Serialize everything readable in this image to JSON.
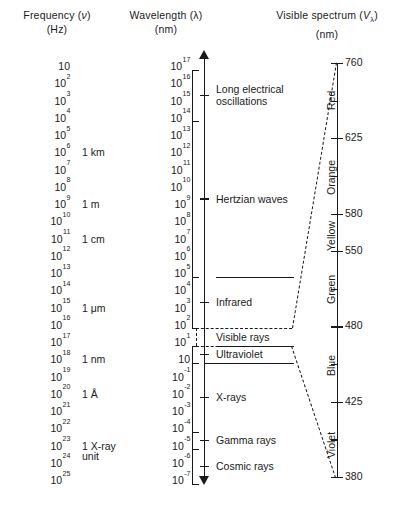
{
  "headers": {
    "frequency": {
      "line1_pre": "Frequency (",
      "line1_sym": "ν",
      "line1_post": ")",
      "line2": "(Hz)"
    },
    "wavelength": {
      "line1_pre": "Wavelength (",
      "line1_sym": "λ",
      "line1_post": ")",
      "line2": "(nm)"
    },
    "visible": {
      "line1_pre": "Visible spectrum (",
      "line1_sym": "V",
      "line1_sub": "λ",
      "line1_post": ")",
      "line2": "(nm)"
    }
  },
  "frequency_column": {
    "base": "10",
    "exponents": [
      "",
      "2",
      "3",
      "4",
      "5",
      "6",
      "7",
      "8",
      "9",
      "10",
      "11",
      "12",
      "13",
      "14",
      "15",
      "16",
      "17",
      "18",
      "19",
      "20",
      "21",
      "22",
      "23",
      "24",
      "25"
    ]
  },
  "wavelength_column": {
    "base": "10",
    "exponents": [
      "17",
      "16",
      "15",
      "14",
      "13",
      "12",
      "11",
      "10",
      "9",
      "8",
      "7",
      "6",
      "5",
      "4",
      "3",
      "2",
      "1",
      "",
      "-1",
      "-2",
      "-3",
      "-4",
      "-5",
      "-6",
      "-7"
    ]
  },
  "unit_markers": [
    {
      "label": "1 km",
      "row": 5
    },
    {
      "label": "1 m",
      "row": 8
    },
    {
      "label": "1 cm",
      "row": 10
    },
    {
      "label": "1 μm",
      "row": 14
    },
    {
      "label": "1 nm",
      "row": 17
    },
    {
      "label": "1 Å",
      "row": 19
    },
    {
      "label": "1 X-ray",
      "label2": "unit",
      "row": 22
    }
  ],
  "bands": [
    {
      "name": "Long electrical\noscillations",
      "top_row": 0,
      "bottom_row": 3
    },
    {
      "name": "Hertzian waves",
      "top_row": 3,
      "bottom_row": 12
    },
    {
      "name": "Infrared",
      "top_row": 12,
      "bottom_row": 15
    },
    {
      "name": "Visible rays",
      "top_row": 15,
      "bottom_row": 16
    },
    {
      "name": "Ultraviolet",
      "top_row": 16,
      "bottom_row": 17
    },
    {
      "name": "X-rays",
      "top_row": 17,
      "bottom_row": 21
    },
    {
      "name": "Gamma rays",
      "top_row": 21,
      "bottom_row": 22
    },
    {
      "name": "Cosmic rays",
      "top_row": 22,
      "bottom_row": 24
    }
  ],
  "visible_spectrum": {
    "ticks": [
      {
        "value": "760",
        "major": true
      },
      {
        "value": "",
        "major": false
      },
      {
        "value": "625",
        "major": true
      },
      {
        "value": "",
        "major": false
      },
      {
        "value": "580",
        "major": true
      },
      {
        "value": "550",
        "major": true
      },
      {
        "value": "",
        "major": false
      },
      {
        "value": "480",
        "major": true
      },
      {
        "value": "",
        "major": false
      },
      {
        "value": "425",
        "major": true
      },
      {
        "value": "",
        "major": false
      },
      {
        "value": "380",
        "major": true
      }
    ],
    "colors": [
      "Red",
      "Orange",
      "Yellow",
      "Green",
      "Blue",
      "Violet"
    ]
  },
  "chart_data": {
    "type": "table",
    "xlabel": "",
    "ylabel": "",
    "series": [
      {
        "name": "Frequency (Hz)",
        "values": [
          "10",
          "10^2",
          "10^3",
          "10^4",
          "10^5",
          "10^6",
          "10^7",
          "10^8",
          "10^9",
          "10^10",
          "10^11",
          "10^12",
          "10^13",
          "10^14",
          "10^15",
          "10^16",
          "10^17",
          "10^18",
          "10^19",
          "10^20",
          "10^21",
          "10^22",
          "10^23",
          "10^24",
          "10^25"
        ]
      },
      {
        "name": "Wavelength (nm)",
        "values": [
          "10^17",
          "10^16",
          "10^15",
          "10^14",
          "10^13",
          "10^12",
          "10^11",
          "10^10",
          "10^9",
          "10^8",
          "10^7",
          "10^6",
          "10^5",
          "10^4",
          "10^3",
          "10^2",
          "10^1",
          "1",
          "10^-1",
          "10^-2",
          "10^-3",
          "10^-4",
          "10^-5",
          "10^-6",
          "10^-7"
        ]
      }
    ],
    "band_ranges": [
      {
        "band": "Long electrical oscillations",
        "freq_hz": "10 - 10^4",
        "wavelength_nm": "10^17 - 10^14"
      },
      {
        "band": "Hertzian waves",
        "freq_hz": "10^4 - 10^13",
        "wavelength_nm": "10^14 - 10^5"
      },
      {
        "band": "Infrared",
        "freq_hz": "10^13 - 10^16",
        "wavelength_nm": "10^5 - 10^2"
      },
      {
        "band": "Visible rays",
        "freq_hz": "10^16 - 10^17",
        "wavelength_nm": "10^2 - 10^1"
      },
      {
        "band": "Ultraviolet",
        "freq_hz": "10^17 - 10^18",
        "wavelength_nm": "10^1 - 1"
      },
      {
        "band": "X-rays",
        "freq_hz": "10^18 - 10^22",
        "wavelength_nm": "1 - 10^-4"
      },
      {
        "band": "Gamma rays",
        "freq_hz": "10^22 - 10^23",
        "wavelength_nm": "10^-4 - 10^-5"
      },
      {
        "band": "Cosmic rays",
        "freq_hz": "10^23 - 10^25",
        "wavelength_nm": "10^-5 - 10^-7"
      }
    ],
    "visible_ticks_nm": [
      760,
      625,
      580,
      550,
      480,
      425,
      380
    ],
    "visible_colors": [
      "Red",
      "Orange",
      "Yellow",
      "Green",
      "Blue",
      "Violet"
    ],
    "grid": false,
    "legend": "none"
  }
}
